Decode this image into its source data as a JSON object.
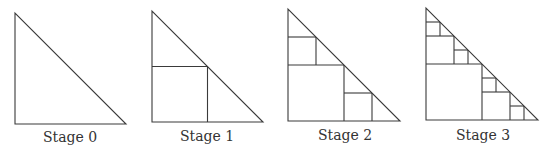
{
  "diagram": {
    "type": "fractal-triangle-squares",
    "line_color": "#3a3a3a",
    "stages": [
      {
        "label": "Stage 0",
        "x0": 15,
        "y0": 13,
        "size": 111,
        "depth": 0,
        "label_x": 70,
        "label_y": 129
      },
      {
        "label": "Stage 1",
        "x0": 152,
        "y0": 11,
        "size": 111,
        "depth": 1,
        "label_x": 207,
        "label_y": 128
      },
      {
        "label": "Stage 2",
        "x0": 288,
        "y0": 9,
        "size": 112,
        "depth": 2,
        "label_x": 345,
        "label_y": 127
      },
      {
        "label": "Stage 3",
        "x0": 426,
        "y0": 8,
        "size": 112,
        "depth": 3,
        "label_x": 483,
        "label_y": 127
      }
    ]
  }
}
